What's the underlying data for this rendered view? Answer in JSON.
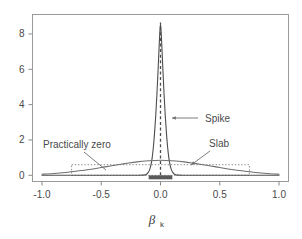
{
  "chart_data": {
    "type": "line",
    "title": "",
    "xlabel": "βk",
    "xlabel_base": "β",
    "xlabel_sub": "k",
    "ylabel": "",
    "xlim": [
      -1.08,
      1.08
    ],
    "ylim": [
      -0.35,
      9.1
    ],
    "xticks": [
      -1.0,
      -0.5,
      0.0,
      0.5,
      1.0
    ],
    "xticklabels": [
      "-1.0",
      "-0.5",
      "0.0",
      "0.5",
      "1.0"
    ],
    "yticks": [
      0,
      2,
      4,
      6,
      8
    ],
    "yticklabels": [
      "0",
      "2",
      "4",
      "6",
      "8"
    ],
    "grid": false,
    "legend_position": "none",
    "series": [
      {
        "name": "Spike",
        "style": "solid",
        "color": "#4d4d4d",
        "description": "narrow normal density centred at 0",
        "peak_value": 8.6,
        "peak_x": 0.0,
        "sd": 0.046,
        "x": [
          -1.0,
          -0.9,
          -0.8,
          -0.7,
          -0.6,
          -0.5,
          -0.4,
          -0.3,
          -0.2,
          -0.15,
          -0.12,
          -0.1,
          -0.09,
          -0.08,
          -0.07,
          -0.06,
          -0.05,
          -0.04,
          -0.03,
          -0.02,
          -0.01,
          0.0,
          0.01,
          0.02,
          0.03,
          0.04,
          0.05,
          0.06,
          0.07,
          0.08,
          0.09,
          0.1,
          0.12,
          0.15,
          0.2,
          0.3,
          0.4,
          0.5,
          0.6,
          0.7,
          0.8,
          0.9,
          1.0
        ],
        "y": [
          0.0,
          0.0,
          0.0,
          0.0,
          0.0,
          0.0,
          0.0,
          0.0,
          0.0,
          0.01,
          0.05,
          0.2,
          0.35,
          0.6,
          1.0,
          1.6,
          2.4,
          3.4,
          4.6,
          6.0,
          7.5,
          8.6,
          7.5,
          6.0,
          4.6,
          3.4,
          2.4,
          1.6,
          1.0,
          0.6,
          0.35,
          0.2,
          0.05,
          0.01,
          0.0,
          0.0,
          0.0,
          0.0,
          0.0,
          0.0,
          0.0,
          0.0,
          0.0
        ]
      },
      {
        "name": "Slab",
        "style": "solid",
        "color": "#6e6e6e",
        "description": "wide flat normal density centred at 0",
        "peak_value": 0.85,
        "peak_x": 0.0,
        "sd": 0.5,
        "x": [
          -1.0,
          -0.9,
          -0.8,
          -0.7,
          -0.6,
          -0.5,
          -0.4,
          -0.3,
          -0.2,
          -0.1,
          0.0,
          0.1,
          0.2,
          0.3,
          0.4,
          0.5,
          0.6,
          0.7,
          0.8,
          0.9,
          1.0
        ],
        "y": [
          0.06,
          0.1,
          0.16,
          0.24,
          0.33,
          0.44,
          0.56,
          0.66,
          0.76,
          0.82,
          0.85,
          0.82,
          0.76,
          0.66,
          0.56,
          0.44,
          0.33,
          0.24,
          0.16,
          0.1,
          0.06
        ]
      }
    ],
    "shapes": [
      {
        "name": "practically-zero-region",
        "type": "dotted-rectangle",
        "x0": -0.75,
        "x1": 0.75,
        "y0": 0.0,
        "y1": 0.6,
        "style": "dotted",
        "color": "#8c8c8c"
      },
      {
        "name": "zero-reference-line",
        "type": "vertical-dashed-line",
        "x": 0.0,
        "y0": 0.0,
        "y1": 8.65,
        "style": "dashed",
        "color": "#4d4d4d"
      },
      {
        "name": "null-interval-bar",
        "type": "thick-horizontal-bar",
        "x0": -0.1,
        "x1": 0.1,
        "y": 0.0,
        "color": "#5a5a5a"
      }
    ],
    "annotations": [
      {
        "name": "spike-annotation",
        "text": "Spike",
        "text_x": 205,
        "text_y": 122,
        "leader_from_x": 198,
        "leader_from_y": 118,
        "leader_to_x": 172,
        "leader_to_y": 118,
        "arrow": true
      },
      {
        "name": "slab-annotation",
        "text": "Slab",
        "text_x": 209,
        "text_y": 147,
        "leader_from_x": 210,
        "leader_from_y": 151,
        "leader_to_x": 191,
        "leader_to_y": 165,
        "arrow": true
      },
      {
        "name": "practically-zero-annotation",
        "text": "Practically zero",
        "text_x": 43,
        "text_y": 148,
        "leader_from_x": 84,
        "leader_from_y": 152,
        "leader_to_x": 106,
        "leader_to_y": 170,
        "arrow": false
      }
    ]
  },
  "figure": {
    "background": "#ffffff",
    "frame_color": "#9a9a9a",
    "tick_color": "#8a8a8a",
    "text_color": "#4a4a4a"
  }
}
